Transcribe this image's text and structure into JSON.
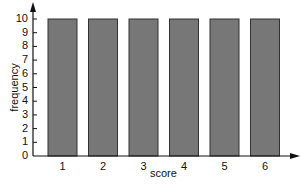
{
  "chart_data": {
    "type": "bar",
    "title": "",
    "xlabel": "score",
    "ylabel": "frequency",
    "categories": [
      "1",
      "2",
      "3",
      "4",
      "5",
      "6"
    ],
    "values": [
      10,
      10,
      10,
      10,
      10,
      10
    ],
    "ylim": [
      0,
      10
    ],
    "yticks": [
      0,
      1,
      2,
      3,
      4,
      5,
      6,
      7,
      8,
      9,
      10
    ],
    "grid": false,
    "legend": null,
    "bar_color": "#777777",
    "bar_edge_color": "#333333"
  }
}
